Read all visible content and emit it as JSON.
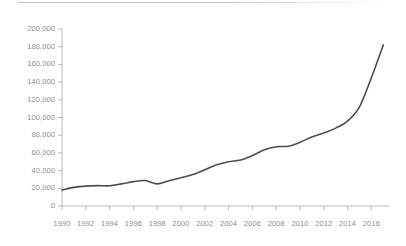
{
  "figure": {
    "background_color": "#ffffff",
    "top_rule_color": "#c2c2c5",
    "axis_color": "#b9b9bd",
    "tick_label_color": "#8c8c90"
  },
  "chart_data": {
    "type": "line",
    "title": "",
    "subtitle": "",
    "xlabel": "",
    "ylabel": "",
    "grid": false,
    "legend": false,
    "line_color": "#4d4d4f",
    "line_width": 1.6,
    "xlim": [
      1990,
      2017
    ],
    "ylim": [
      0,
      200000
    ],
    "x_tick_labels": [
      "1990",
      "1992",
      "1994",
      "1996",
      "1998",
      "2000",
      "2002",
      "2004",
      "2006",
      "2008",
      "2010",
      "2012",
      "2014",
      "2016"
    ],
    "x_tick_values": [
      1990,
      1992,
      1994,
      1996,
      1998,
      2000,
      2002,
      2004,
      2006,
      2008,
      2010,
      2012,
      2014,
      2016
    ],
    "y_tick_labels": [
      "0",
      "20,000",
      "40,000",
      "60,000",
      "80,000",
      "100,000",
      "120,000",
      "140,000",
      "160,000",
      "180,000",
      "200,000"
    ],
    "y_tick_values": [
      0,
      20000,
      40000,
      60000,
      80000,
      100000,
      120000,
      140000,
      160000,
      180000,
      200000
    ],
    "x": [
      1990,
      1991,
      1992,
      1993,
      1994,
      1995,
      1996,
      1997,
      1998,
      1999,
      2000,
      2001,
      2002,
      2003,
      2004,
      2005,
      2006,
      2007,
      2008,
      2009,
      2010,
      2011,
      2012,
      2013,
      2014,
      2015,
      2016,
      2017
    ],
    "values": [
      18000,
      21000,
      22500,
      23000,
      22800,
      25000,
      27500,
      28800,
      25000,
      28500,
      32000,
      35500,
      41000,
      46500,
      50000,
      52000,
      57000,
      63500,
      67000,
      67500,
      72000,
      78000,
      82500,
      88000,
      96000,
      112000,
      145000,
      182000
    ],
    "series": [
      {
        "name": "value",
        "values": [
          18000,
          21000,
          22500,
          23000,
          22800,
          25000,
          27500,
          28800,
          25000,
          28500,
          32000,
          35500,
          41000,
          46500,
          50000,
          52000,
          57000,
          63500,
          67000,
          67500,
          72000,
          78000,
          82500,
          88000,
          96000,
          112000,
          145000,
          182000
        ]
      }
    ]
  }
}
